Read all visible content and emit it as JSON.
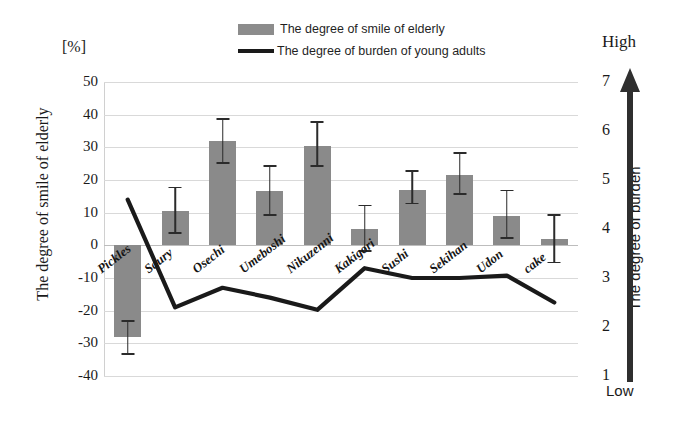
{
  "legend": {
    "items": [
      {
        "label": "The degree of smile of elderly",
        "type": "bar",
        "color": "#8a8a8a"
      },
      {
        "label": "The degree of burden of young adults",
        "type": "line",
        "color": "#1a1a1a"
      }
    ]
  },
  "axes": {
    "unit_label": "[%]",
    "left_title": "The degree of smile of elderly",
    "right_title": "The degree of burden",
    "right_high_label": "High",
    "right_low_label": "Low",
    "left_ticks": [
      "50",
      "40",
      "30",
      "20",
      "10",
      "0",
      "-10",
      "-20",
      "-30",
      "-40"
    ],
    "right_ticks": [
      "7",
      "6",
      "5",
      "4",
      "3",
      "2",
      "1"
    ]
  },
  "chart_data": {
    "type": "bar",
    "title": "",
    "xlabel": "",
    "ylabel": "The degree of smile of elderly",
    "ylim": [
      -40,
      50
    ],
    "y2lim": [
      1,
      7
    ],
    "y2label": "The degree of burden",
    "grid": true,
    "legend_position": "top-center",
    "categories": [
      "Pickles",
      "Saury",
      "Osechi",
      "Umeboshi",
      "Nikuzenni",
      "Kakigori",
      "Sushi",
      "Sekihan",
      "Udon",
      "cake"
    ],
    "series": [
      {
        "name": "The degree of smile of elderly",
        "type": "bar",
        "axis": "left",
        "unit": "%",
        "values": [
          -28,
          10.5,
          32,
          16.5,
          30.5,
          5,
          17,
          21.5,
          9,
          2
        ],
        "error_upper": [
          -23,
          18,
          39,
          24.5,
          38,
          12.5,
          23,
          28.5,
          17,
          9.5
        ],
        "error_lower": [
          -33.5,
          3.5,
          25,
          9,
          24,
          -2,
          12.5,
          15.5,
          2,
          -5.5
        ]
      },
      {
        "name": "The degree of burden of young adults",
        "type": "line",
        "axis": "right",
        "values": [
          4.6,
          2.4,
          2.8,
          2.6,
          2.35,
          3.2,
          3.0,
          3.0,
          3.05,
          2.5
        ]
      }
    ]
  }
}
